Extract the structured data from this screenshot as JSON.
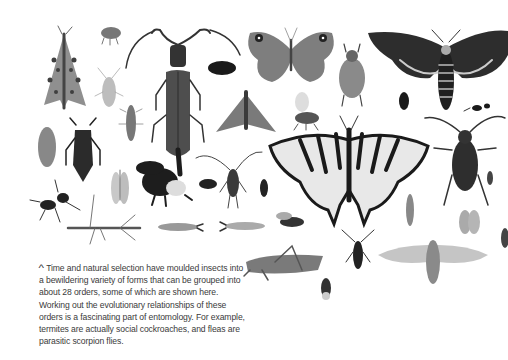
{
  "figure": {
    "specimens": [
      {
        "name": "spotted moth",
        "x": 64,
        "y": 65
      },
      {
        "name": "small weevil",
        "x": 110,
        "y": 35
      },
      {
        "name": "longhorn beetle",
        "x": 178,
        "y": 100
      },
      {
        "name": "small black beetle",
        "x": 222,
        "y": 68
      },
      {
        "name": "meadow brown butterfly",
        "x": 291,
        "y": 55
      },
      {
        "name": "scarab beetle",
        "x": 352,
        "y": 72
      },
      {
        "name": "death's-head hawkmoth",
        "x": 446,
        "y": 62
      },
      {
        "name": "aphid",
        "x": 108,
        "y": 90
      },
      {
        "name": "silverfish larva",
        "x": 130,
        "y": 120
      },
      {
        "name": "noctuid moth",
        "x": 246,
        "y": 112
      },
      {
        "name": "honey bee",
        "x": 307,
        "y": 113
      },
      {
        "name": "small black beetle 2",
        "x": 404,
        "y": 101
      },
      {
        "name": "ant",
        "x": 482,
        "y": 108
      },
      {
        "name": "woodlouse-like larva",
        "x": 47,
        "y": 147
      },
      {
        "name": "jewel beetle",
        "x": 83,
        "y": 150
      },
      {
        "name": "lacewing",
        "x": 120,
        "y": 184
      },
      {
        "name": "bumble bee",
        "x": 166,
        "y": 182
      },
      {
        "name": "tiny beetle",
        "x": 208,
        "y": 184
      },
      {
        "name": "assassin bug",
        "x": 233,
        "y": 175
      },
      {
        "name": "click beetle",
        "x": 264,
        "y": 188
      },
      {
        "name": "swallowtail butterfly",
        "x": 349,
        "y": 160
      },
      {
        "name": "ground beetle",
        "x": 465,
        "y": 160
      },
      {
        "name": "small wasp",
        "x": 490,
        "y": 178
      },
      {
        "name": "ant 2",
        "x": 55,
        "y": 203
      },
      {
        "name": "stick insect",
        "x": 103,
        "y": 228
      },
      {
        "name": "earwig",
        "x": 180,
        "y": 227
      },
      {
        "name": "earwig 2",
        "x": 240,
        "y": 226
      },
      {
        "name": "hoverfly",
        "x": 292,
        "y": 222
      },
      {
        "name": "caddisfly",
        "x": 410,
        "y": 210
      },
      {
        "name": "stonefly",
        "x": 469,
        "y": 222
      },
      {
        "name": "grasshopper",
        "x": 282,
        "y": 263
      },
      {
        "name": "longhorn beetle 2",
        "x": 358,
        "y": 250
      },
      {
        "name": "cicada",
        "x": 433,
        "y": 255
      },
      {
        "name": "fly",
        "x": 326,
        "y": 287
      },
      {
        "name": "partial insect right edge",
        "x": 503,
        "y": 238
      }
    ]
  },
  "caption": {
    "marker": "^",
    "text": "Time and natural selection have moulded insects into a bewildering variety of forms that can be grouped into about 28 orders, some of which are shown here. Working out the evolutionary relationships of these orders is a fascinating part of entomology. For example, termites are actually social cockroaches, and fleas are parasitic scorpion flies."
  }
}
